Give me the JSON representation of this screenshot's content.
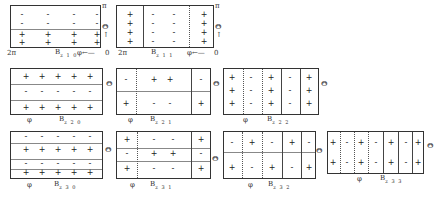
{
  "labels": {
    "theta": "Θ",
    "phi": "φ",
    "pi": "π",
    "two_pi": "2π",
    "zero": "0",
    "B": "B",
    "arrow_left": "←—",
    "arrow_up": "↑"
  },
  "panels": [
    {
      "id": "B_z10",
      "subscript": "z 1 0",
      "rows": [
        [
          "-",
          "-",
          "-",
          "-"
        ],
        [
          "-",
          "-",
          "-",
          "-"
        ],
        [
          "+",
          "+",
          "+",
          "+"
        ],
        [
          "+",
          "+",
          "+",
          "+"
        ]
      ]
    },
    {
      "id": "B_z11",
      "subscript": "z 1 1",
      "columns": [
        [
          "+",
          "+",
          "+",
          "+"
        ],
        [
          "-",
          "-",
          "-",
          "-"
        ],
        [
          "-",
          "-",
          "-",
          "-"
        ],
        [
          "+",
          "+",
          "+",
          "+"
        ]
      ]
    },
    {
      "id": "B_z20",
      "subscript": "z 2 0",
      "rows": [
        [
          "+",
          "+",
          "+",
          "+",
          "+"
        ],
        [
          "-",
          "-",
          "-",
          "-",
          "-"
        ],
        [
          "+",
          "+",
          "+",
          "+",
          "+"
        ]
      ]
    },
    {
      "id": "B_z21",
      "subscript": "z 2 1",
      "rows": [
        [
          "-",
          "+",
          "+",
          "-"
        ],
        [
          "+",
          "-",
          "-",
          "+"
        ]
      ]
    },
    {
      "id": "B_z22",
      "subscript": "z 2 2",
      "rows": [
        [
          "+",
          "-",
          "+",
          "-",
          "+"
        ],
        [
          "+",
          "-",
          "+",
          "-",
          "+"
        ],
        [
          "+",
          "-",
          "+",
          "-",
          "+"
        ]
      ]
    },
    {
      "id": "B_z30",
      "subscript": "z 3 0",
      "rows": [
        [
          "-",
          "-",
          "-",
          "-",
          "-"
        ],
        [
          "+",
          "+",
          "+",
          "+",
          "+"
        ],
        [
          "-",
          "-",
          "-",
          "-",
          "-"
        ],
        [
          "+",
          "+",
          "+",
          "+",
          "+"
        ]
      ]
    },
    {
      "id": "B_z31",
      "subscript": "z 3 1",
      "rows": [
        [
          "+",
          "-",
          "-",
          "+"
        ],
        [
          "-",
          "+",
          "+",
          "-"
        ],
        [
          "+",
          "-",
          "-",
          "+"
        ]
      ]
    },
    {
      "id": "B_z32",
      "subscript": "z 3 2",
      "rows": [
        [
          "-",
          "+",
          "-",
          "+",
          "-"
        ],
        [
          "+",
          "-",
          "+",
          "-",
          "+"
        ]
      ]
    },
    {
      "id": "B_z33",
      "subscript": "z 3 3",
      "rows": [
        [
          "+",
          "-",
          "+",
          "-",
          "+",
          "-",
          "+"
        ],
        [
          "+",
          "-",
          "+",
          "-",
          "+",
          "-",
          "+"
        ]
      ]
    }
  ]
}
